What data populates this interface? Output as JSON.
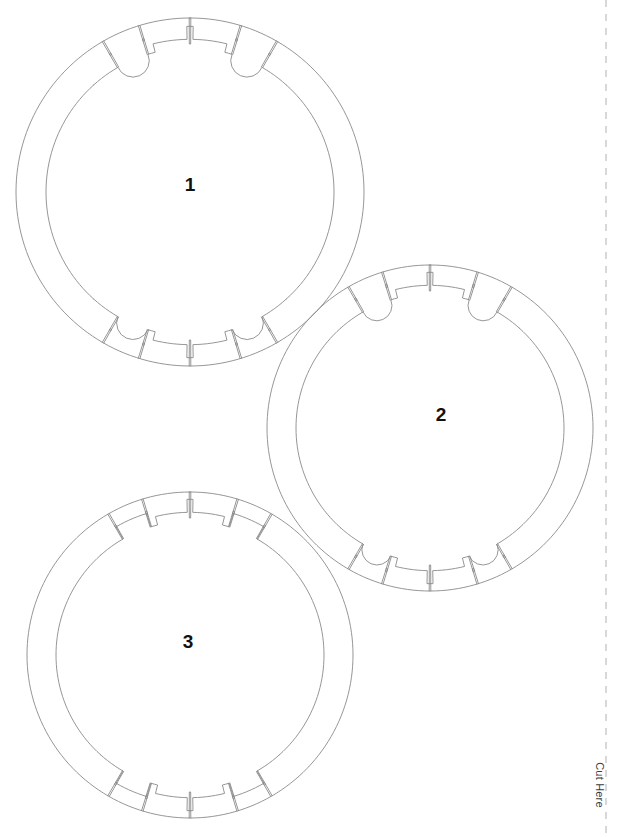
{
  "document": {
    "type": "papercraft-cut-template",
    "title": "Ring Cut Template",
    "page_width": 623,
    "page_height": 837,
    "background_color": "#ffffff",
    "line_color": "#8a8a8a",
    "line_width": 0.9,
    "label_color": "#111111"
  },
  "cut_guide": {
    "label": "Cut Here",
    "orientation": "vertical",
    "x": 606,
    "dash_color": "#b9b9b9",
    "dash_pattern": "7 7",
    "label_x": 600,
    "label_y": 785
  },
  "parts": [
    {
      "id": "part-1",
      "label": "1",
      "cx": 190,
      "cy": 192,
      "outer_r": 174,
      "inner_r": 144,
      "label_x": 190,
      "label_y": 184,
      "tab_style": "rounded-bumps",
      "notch_count": 10
    },
    {
      "id": "part-2",
      "label": "2",
      "cx": 430,
      "cy": 428,
      "outer_r": 163,
      "inner_r": 134,
      "label_x": 441,
      "label_y": 414,
      "tab_style": "rounded-bumps",
      "notch_count": 10
    },
    {
      "id": "part-3",
      "label": "3",
      "cx": 190,
      "cy": 655,
      "outer_r": 163,
      "inner_r": 134,
      "label_x": 188,
      "label_y": 641,
      "tab_style": "flat-steps",
      "notch_count": 10
    }
  ]
}
